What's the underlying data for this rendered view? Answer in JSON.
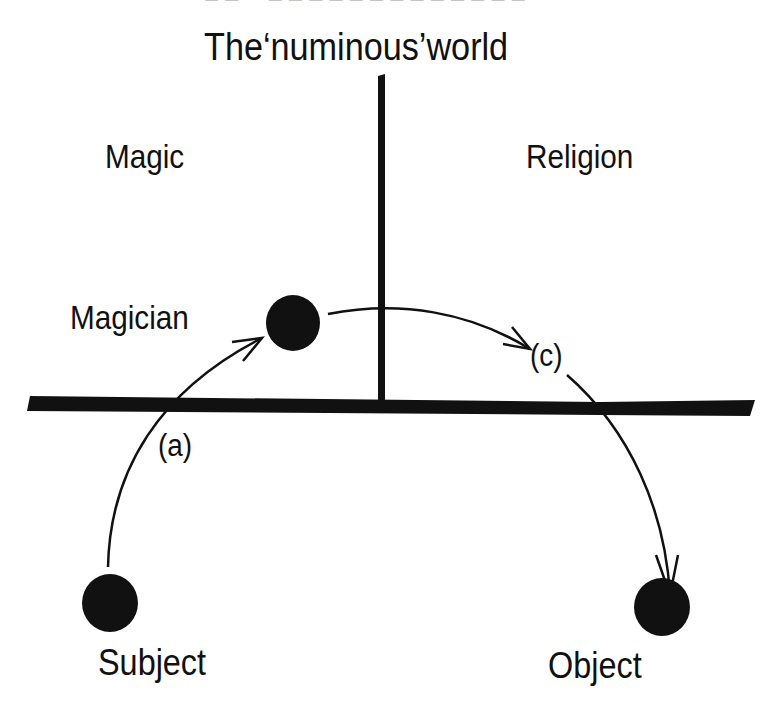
{
  "header": {
    "cropped_running_head": "— — · · — — — — — — — — — — — — —"
  },
  "diagram": {
    "title": "The‘numinous’world",
    "regions": {
      "left": "Magic",
      "right": "Religion"
    },
    "nodes": {
      "magician": "Magician",
      "subject": "Subject",
      "object": "Object"
    },
    "arrows": {
      "a": "(a)",
      "c": "(c)"
    },
    "colors": {
      "ink": "#111111",
      "background": "#ffffff"
    }
  }
}
